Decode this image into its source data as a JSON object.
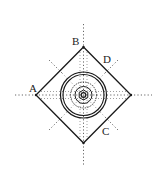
{
  "diagram": {
    "type": "square-with-concentric-circles",
    "labels": {
      "A": "A",
      "B": "B",
      "C": "C",
      "D": "D"
    },
    "colors": {
      "stroke": "#1a1a1a",
      "dotted": "#555555",
      "background": "#ffffff"
    }
  }
}
